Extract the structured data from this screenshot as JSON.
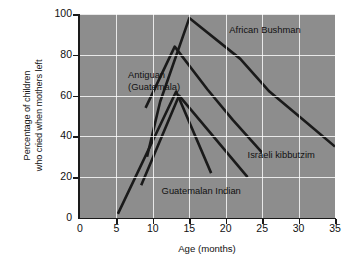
{
  "chart_data": {
    "type": "line",
    "title": "",
    "xlabel": "Age (months)",
    "ylabel": "Percentage of children who cried when mothers left",
    "ylabel_line1": "Percentage of children",
    "ylabel_line2": "who cried when mothers left",
    "xlim": [
      0,
      35
    ],
    "ylim": [
      0,
      100
    ],
    "xticks": [
      0,
      5,
      10,
      15,
      20,
      25,
      30,
      35
    ],
    "yticks": [
      0,
      20,
      40,
      60,
      80,
      100
    ],
    "grid": true,
    "legend_position": "inline-annotations",
    "plot_background": "#8d8d8d",
    "grid_color": "#ffffff",
    "line_color": "#1a1a1a",
    "series": [
      {
        "name": "African Bushman",
        "points": [
          [
            9.2,
            30
          ],
          [
            11.0,
            57
          ],
          [
            15.0,
            98
          ],
          [
            22.0,
            78
          ],
          [
            26.0,
            62
          ],
          [
            31.0,
            47
          ],
          [
            35.0,
            35
          ]
        ]
      },
      {
        "name": "Antiguan (Guatemala)",
        "points": [
          [
            9.0,
            54
          ],
          [
            13.0,
            84
          ],
          [
            17.5,
            63
          ],
          [
            21.0,
            48
          ],
          [
            25.0,
            32
          ]
        ]
      },
      {
        "name": "Guatemalan Indian",
        "points": [
          [
            5.2,
            2
          ],
          [
            13.2,
            62
          ],
          [
            18.0,
            22
          ]
        ]
      },
      {
        "name": "Israeli kibbutzim",
        "points": [
          [
            8.4,
            16
          ],
          [
            13.6,
            60
          ],
          [
            23.0,
            20
          ]
        ]
      }
    ],
    "annotations": [
      {
        "text": "African Bushman",
        "x": 20.5,
        "y": 92
      },
      {
        "text": "Antiguan",
        "x": 6.6,
        "y": 70
      },
      {
        "text": "(Guatemala)",
        "x": 6.6,
        "y": 64
      },
      {
        "text": "Israeli kibbutzim",
        "x": 23.0,
        "y": 31
      },
      {
        "text": "Guatemalan Indian",
        "x": 11.2,
        "y": 13
      }
    ]
  },
  "xtick_labels": [
    "0",
    "5",
    "10",
    "15",
    "20",
    "25",
    "30",
    "35"
  ],
  "ytick_labels": [
    "0",
    "20",
    "40",
    "60",
    "80",
    "100"
  ],
  "annotation_labels": {
    "african_bushman": "African Bushman",
    "antiguan_line1": "Antiguan",
    "antiguan_line2": "(Guatemala)",
    "israeli_kibbutzim": "Israeli kibbutzim",
    "guatemalan_indian": "Guatemalan Indian"
  }
}
